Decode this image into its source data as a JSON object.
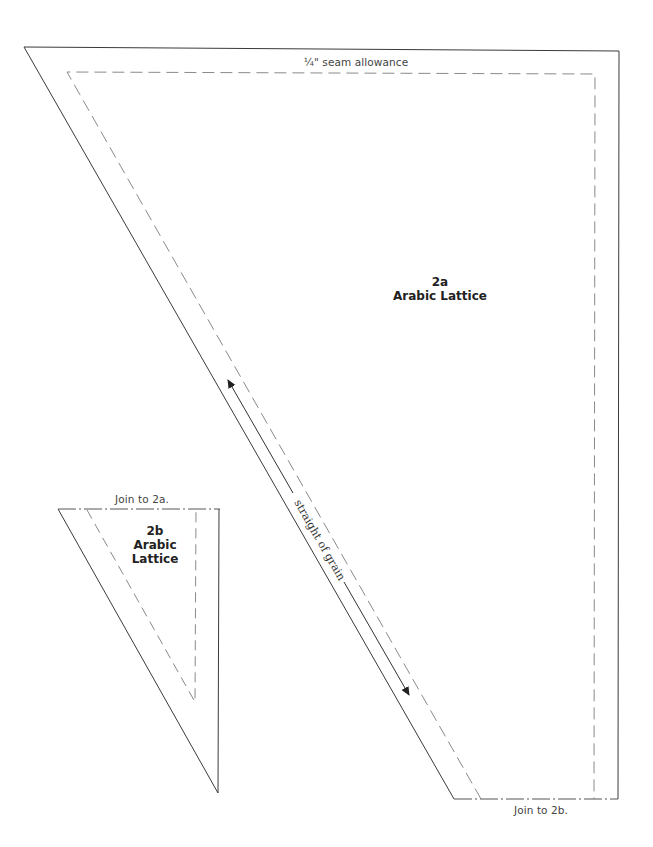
{
  "pattern_2a": {
    "id": "2a",
    "name": "Arabic Lattice",
    "seam_label": "¼\" seam allowance",
    "join_label": "Join to 2b.",
    "grain_label": "straight of grain"
  },
  "pattern_2b": {
    "id": "2b",
    "name_line1": "Arabic",
    "name_line2": "Lattice",
    "join_label": "Join to 2a."
  },
  "colors": {
    "outline": "#3a3a3a",
    "dashed": "#8a8a8a",
    "background": "#ffffff"
  }
}
